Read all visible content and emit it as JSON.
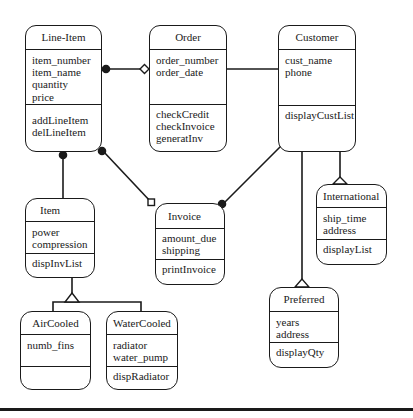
{
  "diagram": {
    "type": "UML class diagram",
    "classes": [
      {
        "id": "line-item",
        "name": "Line-Item",
        "attributes": [
          "item_number",
          "item_name",
          "quantity",
          "price"
        ],
        "operations": [
          "addLineItem",
          "delLineItem"
        ]
      },
      {
        "id": "order",
        "name": "Order",
        "attributes": [
          "order_number",
          "order_date"
        ],
        "operations": [
          "checkCredit",
          "checkInvoice",
          "generatInv"
        ]
      },
      {
        "id": "customer",
        "name": "Customer",
        "attributes": [
          "cust_name",
          "phone"
        ],
        "operations": [
          "displayCustList"
        ]
      },
      {
        "id": "item",
        "name": "Item",
        "attributes": [
          "power",
          "compression"
        ],
        "operations": [
          "dispInvList"
        ]
      },
      {
        "id": "invoice",
        "name": "Invoice",
        "attributes": [
          "amount_due",
          "shipping"
        ],
        "operations": [
          "printInvoice"
        ]
      },
      {
        "id": "international",
        "name": "International",
        "attributes": [
          "ship_time",
          "address"
        ],
        "operations": [
          "displayList"
        ]
      },
      {
        "id": "preferred",
        "name": "Preferred",
        "attributes": [
          "years",
          "address"
        ],
        "operations": [
          "displayQty"
        ]
      },
      {
        "id": "air-cooled",
        "name": "AirCooled",
        "attributes": [
          "numb_fins"
        ],
        "operations": []
      },
      {
        "id": "water-cooled",
        "name": "WaterCooled",
        "attributes": [
          "radiator",
          "water_pump"
        ],
        "operations": [
          "dispRadiator"
        ]
      }
    ],
    "relationships": [
      {
        "from": "Line-Item",
        "to": "Order",
        "kind": "aggregation",
        "from_end": "filled-circle",
        "to_end": "open-diamond"
      },
      {
        "from": "Order",
        "to": "Customer",
        "kind": "association",
        "from_end": "filled-circle",
        "to_end": "none"
      },
      {
        "from": "Line-Item",
        "to": "Item",
        "kind": "association",
        "from_end": "filled-circle",
        "to_end": "none"
      },
      {
        "from": "Line-Item",
        "to": "Invoice",
        "kind": "association",
        "from_end": "filled-circle",
        "to_end": "open-square"
      },
      {
        "from": "Customer",
        "to": "Invoice",
        "kind": "association",
        "from_end": "none",
        "to_end": "filled-circle"
      },
      {
        "from": "International",
        "to": "Customer",
        "kind": "generalization"
      },
      {
        "from": "Preferred",
        "to": "Customer",
        "kind": "generalization"
      },
      {
        "from": "AirCooled",
        "to": "Item",
        "kind": "generalization"
      },
      {
        "from": "WaterCooled",
        "to": "Item",
        "kind": "generalization"
      }
    ],
    "colors": {
      "stroke": "#1a1a1a",
      "background": "#ffffff"
    }
  }
}
